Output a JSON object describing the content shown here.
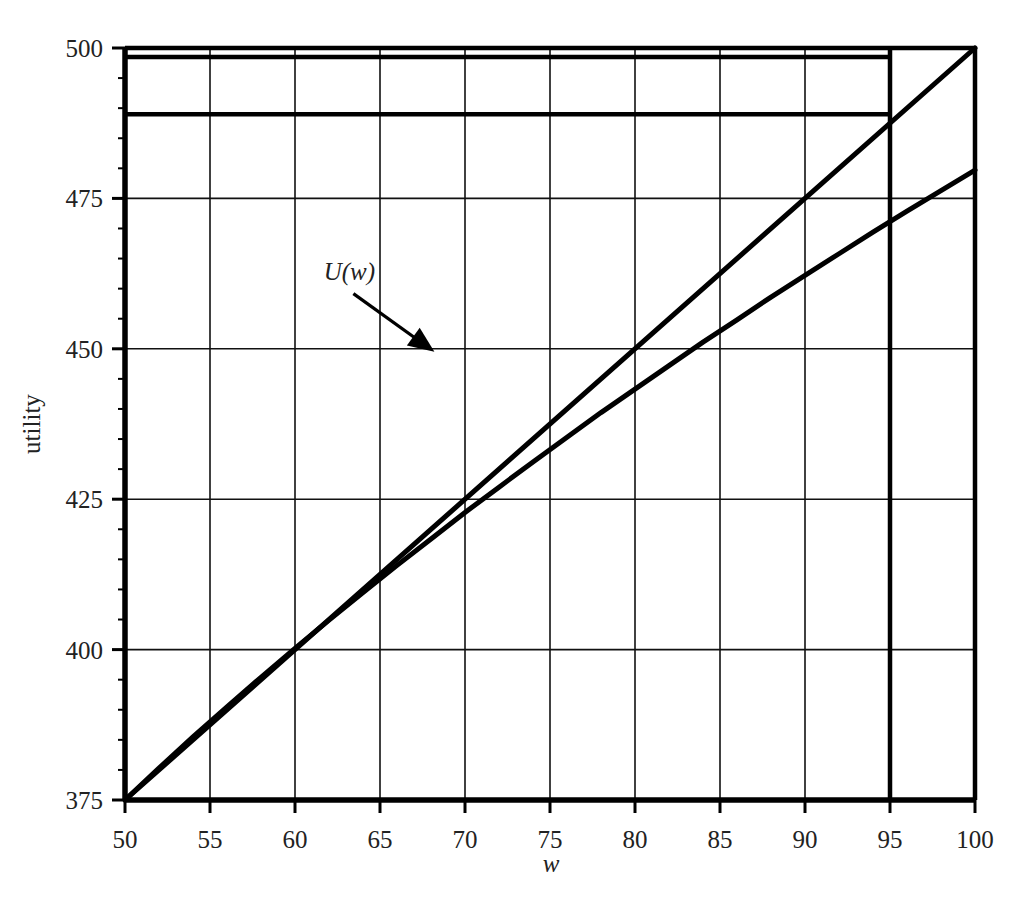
{
  "chart_data": {
    "type": "line",
    "title": "",
    "xlabel": "w",
    "ylabel": "utility",
    "xlim": [
      50,
      100
    ],
    "ylim": [
      375,
      500
    ],
    "grid": true,
    "legend": null,
    "x_ticks": [
      50,
      55,
      60,
      65,
      70,
      75,
      80,
      85,
      90,
      95,
      100
    ],
    "x_tick_labels": [
      "50",
      "55",
      "60",
      "65",
      "70",
      "75",
      "80",
      "85",
      "90",
      "95",
      "100"
    ],
    "y_ticks": [
      375,
      400,
      425,
      450,
      475,
      500
    ],
    "y_tick_labels": [
      "375",
      "400",
      "425",
      "450",
      "475",
      "500"
    ],
    "y_minor_tick_step": 5,
    "series": [
      {
        "name": "U(w)",
        "kind": "concave utility curve",
        "color": "#000000",
        "x": [
          50,
          52,
          54,
          56,
          58,
          60,
          62,
          64,
          66,
          68,
          70,
          72,
          74,
          76,
          78,
          80,
          82,
          84,
          86,
          88,
          90,
          92,
          94,
          96,
          98,
          100
        ],
        "y": [
          375.0,
          380.3,
          385.5,
          390.5,
          395.4,
          400.2,
          404.9,
          409.5,
          414.0,
          418.4,
          422.8,
          427.0,
          431.2,
          435.3,
          439.4,
          443.3,
          447.2,
          451.1,
          454.8,
          458.6,
          462.2,
          465.8,
          469.4,
          472.9,
          476.3,
          479.7
        ]
      },
      {
        "name": "chord",
        "kind": "straight line from endpoint to endpoint",
        "color": "#000000",
        "x": [
          50,
          100
        ],
        "y": [
          375,
          500
        ]
      }
    ],
    "reference_lines": [
      {
        "name": "upper-horizontal-line",
        "orientation": "horizontal",
        "y": 498.5,
        "x_from": 50,
        "x_to": 95
      },
      {
        "name": "lower-horizontal-line",
        "orientation": "horizontal",
        "y": 489.0,
        "x_from": 50,
        "x_to": 95
      },
      {
        "name": "vertical-line-at-95",
        "orientation": "vertical",
        "x": 95,
        "y_from": 375,
        "y_to": 500
      }
    ],
    "annotations": [
      {
        "name": "u-of-w-label",
        "text": "U(w)",
        "x": 63.2,
        "y": 461.5,
        "arrow_to_x": 68.2,
        "arrow_to_y": 449.5
      }
    ]
  },
  "axes": {
    "x_title": "w",
    "y_title": "utility"
  },
  "labels": {
    "curve_label": "U(w)"
  }
}
